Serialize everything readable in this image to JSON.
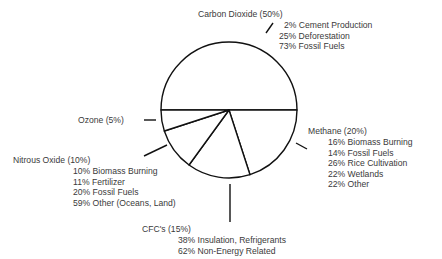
{
  "chart_data": {
    "type": "pie",
    "title": "",
    "slices": [
      {
        "name": "Carbon Dioxide",
        "value": 50,
        "label": "Carbon Dioxide (50%)",
        "breakdown": [
          "2% Cement Production",
          "25% Deforestation",
          "73% Fossil Fuels"
        ]
      },
      {
        "name": "Methane",
        "value": 20,
        "label": "Methane (20%)",
        "breakdown": [
          "16% Biomass Burning",
          "14% Fossil Fuels",
          "26% Rice Cultivation",
          "22% Wetlands",
          "22% Other"
        ]
      },
      {
        "name": "CFC's",
        "value": 15,
        "label": "CFC's (15%)",
        "breakdown": [
          "38% Insulation, Refrigerants",
          "62% Non-Energy Related"
        ]
      },
      {
        "name": "Nitrous Oxide",
        "value": 10,
        "label": "Nitrous Oxide (10%)",
        "breakdown": [
          "10% Biomass Burning",
          "11% Fertilizer",
          "20% Fossil Fuels",
          "59% Other (Oceans, Land)"
        ]
      },
      {
        "name": "Ozone",
        "value": 5,
        "label": "Ozone (5%)",
        "breakdown": []
      }
    ],
    "colors": {
      "fill": "#ffffff",
      "stroke": "#111111",
      "text": "#3a3a3a"
    },
    "legend": "none"
  }
}
